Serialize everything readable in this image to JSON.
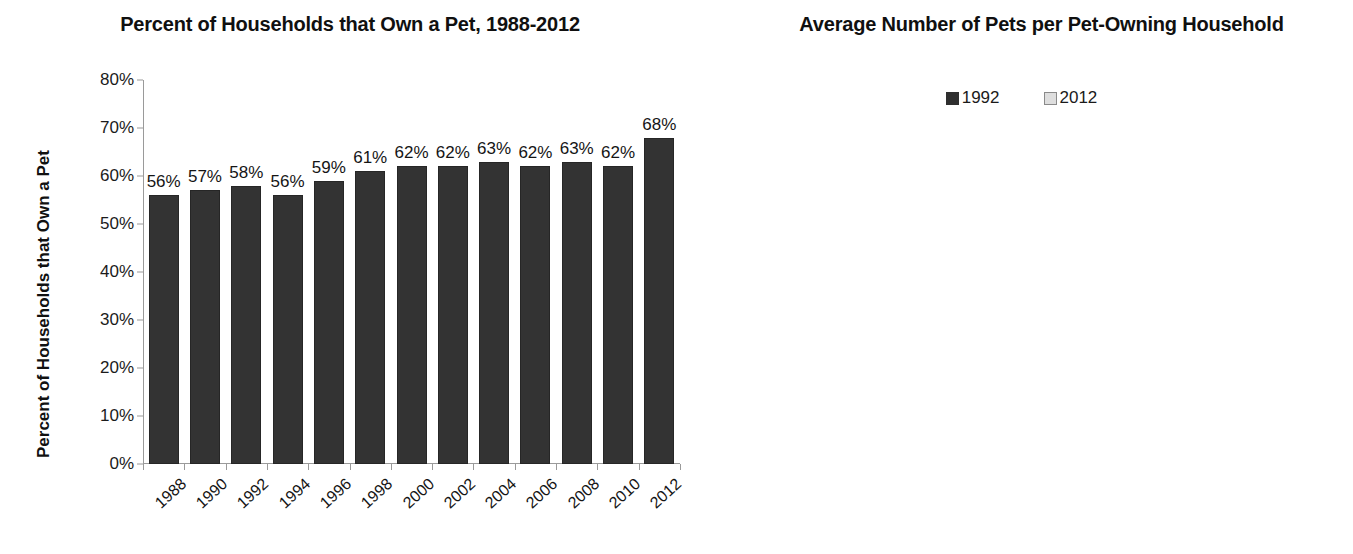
{
  "chart_data": [
    {
      "type": "bar",
      "title": "Percent of Households that Own a Pet, 1988-2012",
      "xlabel": "",
      "ylabel": "Percent of Households that Own a Pet",
      "categories": [
        "1988",
        "1990",
        "1992",
        "1994",
        "1996",
        "1998",
        "2000",
        "2002",
        "2004",
        "2006",
        "2008",
        "2010",
        "2012"
      ],
      "values": [
        56,
        57,
        58,
        56,
        59,
        61,
        62,
        62,
        63,
        62,
        63,
        62,
        68
      ],
      "data_labels": [
        "56%",
        "57%",
        "58%",
        "56%",
        "59%",
        "61%",
        "62%",
        "62%",
        "63%",
        "62%",
        "63%",
        "62%",
        "68%"
      ],
      "ylim": [
        0,
        80
      ],
      "ytick_values": [
        0,
        10,
        20,
        30,
        40,
        50,
        60,
        70,
        80
      ],
      "ytick_labels": [
        "0%",
        "10%",
        "20%",
        "30%",
        "40%",
        "50%",
        "60%",
        "70%",
        "80%"
      ],
      "grid": false,
      "legend": false,
      "series_color": "#333333"
    },
    {
      "type": "bar",
      "title": "Average Number of Pets per Pet-Owning Household",
      "xlabel": "",
      "ylabel": "Average Number of Pets per Owning HH",
      "categories": [
        "Cats",
        "Dogs",
        "Small Animals and Reptiles",
        "Birds",
        "Freshwater Fish"
      ],
      "category_lines": [
        [
          "Cats"
        ],
        [
          "Dogs"
        ],
        [
          "Small",
          "Animals",
          "and Reptiles"
        ],
        [
          "Birds"
        ],
        [
          "Freshwater",
          "Fish"
        ]
      ],
      "series": [
        {
          "name": "1992",
          "color": "#333333",
          "values": [
            1.9,
            1.5,
            1.8,
            2.1,
            9.7
          ],
          "data_labels": [
            "1.9",
            "1.5",
            "1.8",
            "2.1",
            "9.7"
          ]
        },
        {
          "name": "2012",
          "color": "#dcdcdc",
          "values": [
            2.1,
            1.5,
            2.4,
            3.0,
            10.1
          ],
          "data_labels": [
            "2.1",
            "1.5",
            "2.4",
            "3.0",
            "10.1"
          ]
        }
      ],
      "ylim": [
        0,
        12
      ],
      "ytick_values": [
        0,
        2,
        4,
        6,
        8,
        10,
        12
      ],
      "ytick_labels": [
        "0",
        "2",
        "4",
        "6",
        "8",
        "10",
        "12"
      ],
      "grid": false,
      "legend": true,
      "legend_position": "top-center"
    }
  ]
}
